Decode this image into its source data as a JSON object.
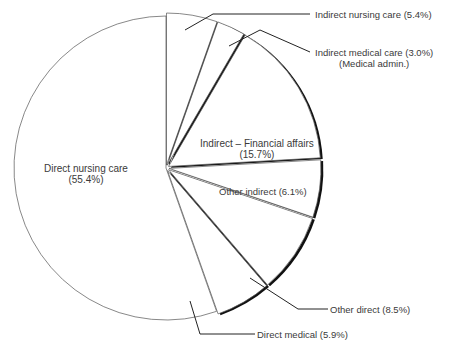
{
  "chart_data": {
    "type": "pie",
    "title": "",
    "start_angle_deg": 0,
    "direction": "clockwise",
    "slices": [
      {
        "label": "Indirect nursing care",
        "value": 5.4,
        "display": "Indirect nursing care (5.4%)"
      },
      {
        "label": "Indirect medical care",
        "sublabel": "(Medical admin.)",
        "value": 3.0,
        "display": "Indirect medical care (3.0%)"
      },
      {
        "label": "Indirect – Financial affairs",
        "value": 15.7,
        "display": "(15.7%)"
      },
      {
        "label": "Other indirect",
        "value": 6.1,
        "display": "Other indirect (6.1%)"
      },
      {
        "label": "Other direct",
        "value": 8.5,
        "display": "Other direct (8.5%)"
      },
      {
        "label": "Direct medical",
        "value": 5.9,
        "display": "Direct medical (5.9%)"
      },
      {
        "label": "Direct nursing care",
        "value": 55.4,
        "display": "(55.4%)"
      }
    ],
    "colors": {
      "fill": "#ffffff",
      "edge": "#111111",
      "shadow": "#111111",
      "leader": "#222222"
    },
    "legend": "none (labels with leader lines)"
  },
  "labels": {
    "indirect_nursing": "Indirect nursing care (5.4%)",
    "indirect_medical": "Indirect medical care (3.0%)",
    "indirect_medical_sub": "(Medical admin.)",
    "financial_1": "Indirect – Financial affairs",
    "financial_2": "(15.7%)",
    "other_indirect": "Other indirect (6.1%)",
    "other_direct": "Other direct (8.5%)",
    "direct_medical": "Direct medical (5.9%)",
    "direct_nursing_1": "Direct nursing care",
    "direct_nursing_2": "(55.4%)"
  }
}
